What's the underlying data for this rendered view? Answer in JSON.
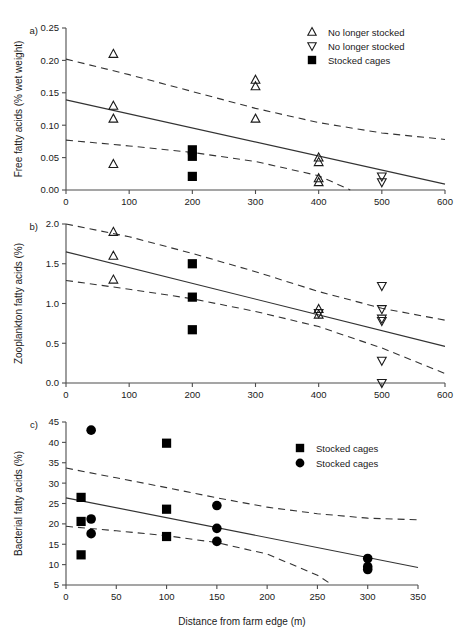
{
  "figure": {
    "xlabel": "Distance from farm edge (m)",
    "colors": {
      "line": "#333333",
      "axis": "#4d4d4d",
      "marker": "#000000"
    }
  },
  "chart_data": [
    {
      "type": "scatter",
      "panel": "a)",
      "title": "",
      "xlabel": "",
      "ylabel": "Free fatty acids (% wet weight)",
      "xlim": [
        0,
        600
      ],
      "ylim": [
        0.0,
        0.25
      ],
      "xticks": [
        0,
        100,
        200,
        300,
        400,
        500,
        600
      ],
      "xticklabels": [
        "0",
        "100",
        "200",
        "300",
        "400",
        "500",
        "600"
      ],
      "yticks": [
        0.0,
        0.05,
        0.1,
        0.15,
        0.2,
        0.25
      ],
      "yticklabels": [
        "0.00",
        "0.05",
        "0.10",
        "0.15",
        "0.20",
        "0.25"
      ],
      "grid": false,
      "legend_position": "top-right",
      "legend": [
        {
          "marker": "triangle-up",
          "label": "No longer stocked"
        },
        {
          "marker": "triangle-down",
          "label": "No longer stocked"
        },
        {
          "marker": "square",
          "label": "Stocked cages"
        }
      ],
      "series": [
        {
          "name": "No longer stocked",
          "marker": "triangle-up",
          "points": [
            [
              75,
              0.21
            ],
            [
              75,
              0.13
            ],
            [
              75,
              0.11
            ],
            [
              75,
              0.04
            ],
            [
              300,
              0.17
            ],
            [
              300,
              0.16
            ],
            [
              300,
              0.11
            ],
            [
              400,
              0.05
            ],
            [
              400,
              0.043
            ],
            [
              400,
              0.018
            ],
            [
              400,
              0.012
            ]
          ]
        },
        {
          "name": "No longer stocked",
          "marker": "triangle-down",
          "points": [
            [
              500,
              0.021
            ],
            [
              500,
              0.012
            ]
          ]
        },
        {
          "name": "Stocked cages",
          "marker": "square",
          "points": [
            [
              200,
              0.062
            ],
            [
              200,
              0.052
            ],
            [
              200,
              0.021
            ]
          ]
        }
      ],
      "fit_line": {
        "x": [
          0,
          600
        ],
        "y": [
          0.139,
          0.009
        ]
      },
      "ci_upper": {
        "x": [
          0,
          100,
          200,
          300,
          400,
          500,
          600
        ],
        "y": [
          0.202,
          0.178,
          0.152,
          0.126,
          0.104,
          0.088,
          0.078
        ]
      },
      "ci_lower": {
        "x": [
          0,
          100,
          200,
          300,
          400,
          450
        ],
        "y": [
          0.077,
          0.068,
          0.058,
          0.044,
          0.022,
          0.0
        ]
      }
    },
    {
      "type": "scatter",
      "panel": "b)",
      "title": "",
      "xlabel": "",
      "ylabel": "Zooplankton fatty acids (%)",
      "xlim": [
        0,
        600
      ],
      "ylim": [
        0.0,
        2.0
      ],
      "xticks": [
        0,
        100,
        200,
        300,
        400,
        500,
        600
      ],
      "xticklabels": [
        "0",
        "100",
        "200",
        "300",
        "400",
        "500",
        "600"
      ],
      "yticks": [
        0.0,
        0.5,
        1.0,
        1.5,
        2.0
      ],
      "yticklabels": [
        "0.0",
        "0.5",
        "1.0",
        "1.5",
        "2.0"
      ],
      "grid": false,
      "legend_position": "none",
      "legend": [],
      "series": [
        {
          "name": "No longer stocked",
          "marker": "triangle-up",
          "points": [
            [
              75,
              1.9
            ],
            [
              75,
              1.6
            ],
            [
              75,
              1.3
            ],
            [
              400,
              0.93
            ],
            [
              400,
              0.86
            ]
          ]
        },
        {
          "name": "No longer stocked",
          "marker": "triangle-down",
          "points": [
            [
              400,
              0.88
            ],
            [
              500,
              1.22
            ],
            [
              500,
              0.93
            ],
            [
              500,
              0.81
            ],
            [
              500,
              0.78
            ],
            [
              500,
              0.28
            ],
            [
              500,
              0.0
            ]
          ]
        },
        {
          "name": "Stocked cages",
          "marker": "square",
          "points": [
            [
              200,
              1.5
            ],
            [
              200,
              1.08
            ],
            [
              200,
              0.67
            ]
          ]
        }
      ],
      "fit_line": {
        "x": [
          0,
          600
        ],
        "y": [
          1.65,
          0.46
        ]
      },
      "ci_upper": {
        "x": [
          0,
          100,
          200,
          300,
          400,
          500,
          600
        ],
        "y": [
          2.0,
          1.84,
          1.63,
          1.4,
          1.15,
          0.94,
          0.79
        ]
      },
      "ci_lower": {
        "x": [
          0,
          100,
          200,
          300,
          400,
          500,
          600
        ],
        "y": [
          1.29,
          1.18,
          1.06,
          0.9,
          0.71,
          0.44,
          0.12
        ]
      }
    },
    {
      "type": "scatter",
      "panel": "c)",
      "title": "",
      "xlabel": "Distance from farm edge (m)",
      "ylabel": "Bacterial fatty acids (%)",
      "xlim": [
        0,
        350
      ],
      "ylim": [
        5,
        45
      ],
      "xticks": [
        0,
        50,
        100,
        150,
        200,
        250,
        300,
        350
      ],
      "xticklabels": [
        "0",
        "50",
        "100",
        "150",
        "200",
        "250",
        "300",
        "350"
      ],
      "yticks": [
        5,
        10,
        15,
        20,
        25,
        30,
        35,
        40,
        45
      ],
      "yticklabels": [
        "5",
        "10",
        "15",
        "20",
        "25",
        "30",
        "35",
        "40",
        "45"
      ],
      "grid": false,
      "legend_position": "top-right",
      "legend": [
        {
          "marker": "square",
          "label": "Stocked cages"
        },
        {
          "marker": "circle",
          "label": "Stocked cages"
        }
      ],
      "series": [
        {
          "name": "Stocked cages",
          "marker": "square",
          "points": [
            [
              15,
              26.5
            ],
            [
              15,
              20.6
            ],
            [
              15,
              12.4
            ],
            [
              100,
              39.8
            ],
            [
              100,
              23.6
            ],
            [
              100,
              16.9
            ]
          ]
        },
        {
          "name": "Stocked cages",
          "marker": "circle",
          "points": [
            [
              25,
              43.0
            ],
            [
              25,
              21.2
            ],
            [
              25,
              17.6
            ],
            [
              150,
              24.5
            ],
            [
              150,
              18.9
            ],
            [
              150,
              15.7
            ],
            [
              300,
              11.5
            ],
            [
              300,
              9.5
            ],
            [
              300,
              8.8
            ]
          ]
        }
      ],
      "fit_line": {
        "x": [
          0,
          350
        ],
        "y": [
          26.4,
          9.3
        ]
      },
      "ci_upper": {
        "x": [
          0,
          50,
          100,
          150,
          200,
          250,
          300,
          350
        ],
        "y": [
          33.7,
          31.3,
          28.9,
          26.4,
          24.1,
          22.5,
          21.4,
          21.0
        ]
      },
      "ci_lower": {
        "x": [
          0,
          50,
          100,
          150,
          200,
          250,
          265
        ],
        "y": [
          19.4,
          18.3,
          17.1,
          15.4,
          12.6,
          7.4,
          5.0
        ]
      }
    }
  ]
}
